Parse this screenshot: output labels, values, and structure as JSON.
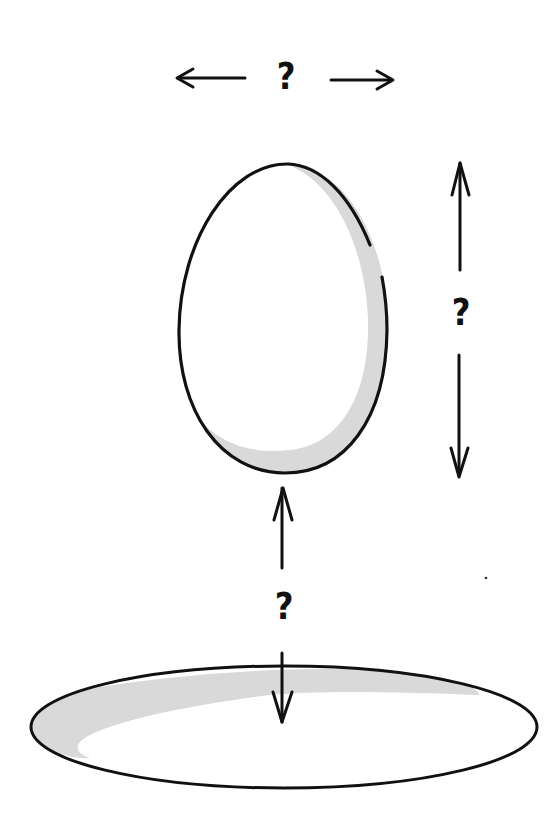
{
  "diagram": {
    "colors": {
      "ink": "#111111",
      "shade": "#d9d9d9",
      "background": "#ffffff"
    },
    "labels": {
      "width_unknown": "?",
      "height_unknown": "?",
      "gap_unknown": "?"
    },
    "elements": [
      {
        "name": "egg",
        "shape": "egg outline with crescent shading on right/bottom"
      },
      {
        "name": "plate",
        "shape": "flat ellipse with shading along top-left rim"
      },
      {
        "name": "width-arrows",
        "direction": "horizontal",
        "label": "?"
      },
      {
        "name": "height-arrows",
        "direction": "vertical",
        "label": "?"
      },
      {
        "name": "gap-arrows",
        "direction": "vertical",
        "label": "?"
      }
    ]
  }
}
